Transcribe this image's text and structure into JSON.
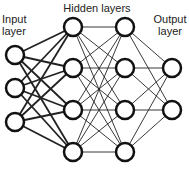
{
  "labels": {
    "input": [
      "Input",
      "layer"
    ],
    "hidden": "Hidden layers",
    "output": [
      "Output",
      "layer"
    ]
  },
  "network": {
    "layers": [
      {
        "name": "input",
        "x": 15,
        "nodes": [
          55,
          88,
          122
        ]
      },
      {
        "name": "hidden1",
        "x": 73,
        "nodes": [
          27,
          68,
          110,
          152
        ]
      },
      {
        "name": "hidden2",
        "x": 125,
        "nodes": [
          27,
          68,
          110,
          152
        ]
      },
      {
        "name": "output",
        "x": 172,
        "nodes": [
          68,
          110
        ]
      }
    ],
    "node_radius": 9,
    "colors": {
      "stroke": "#111111",
      "fill": "#ffffff",
      "edge": "#222222"
    }
  }
}
